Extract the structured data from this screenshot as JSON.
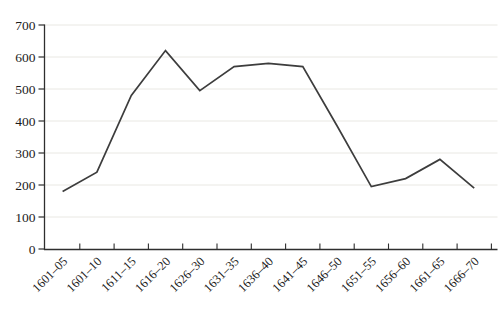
{
  "chart_data": {
    "type": "line",
    "categories": [
      "1601–05",
      "1601–10",
      "1611–15",
      "1616–20",
      "1626–30",
      "1631–35",
      "1636–40",
      "1641–45",
      "1646–50",
      "1651–55",
      "1656–60",
      "1661–65",
      "1666–70"
    ],
    "values": [
      180,
      240,
      480,
      620,
      495,
      570,
      580,
      570,
      385,
      195,
      220,
      280,
      190
    ],
    "title": "",
    "xlabel": "",
    "ylabel": "",
    "ylim": [
      0,
      700
    ],
    "yticks": [
      0,
      100,
      200,
      300,
      400,
      500,
      600,
      700
    ],
    "grid": "horizontal-only",
    "legend": "none",
    "x_label_rotation_deg": 45,
    "colors": {
      "line": "#3d3d3d",
      "grid": "#e9e8e3",
      "axis": "#2e2e2e",
      "text": "#1c1c1c",
      "background": "#ffffff"
    }
  }
}
